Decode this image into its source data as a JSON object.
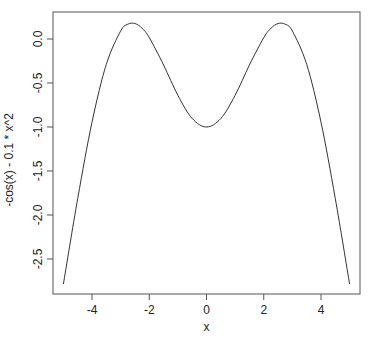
{
  "chart_data": {
    "type": "line",
    "title": "",
    "xlabel": "x",
    "ylabel": "-cos(x) - 0.1 * x^2",
    "xlim": [
      -5,
      5
    ],
    "ylim": [
      -2.78,
      0.18
    ],
    "grid": false,
    "legend": null,
    "x_ticks": [
      "-4",
      "-2",
      "0",
      "2",
      "4"
    ],
    "y_ticks": [
      "0.0",
      "-0.5",
      "-1.0",
      "-1.5",
      "-2.0",
      "-2.5"
    ],
    "series": [
      {
        "name": "-cos(x) - 0.1 * x^2",
        "x": [
          -5,
          -4.5,
          -4,
          -3.5,
          -3,
          -2.75,
          -2.5,
          -2.25,
          -2,
          -1.5,
          -1,
          -0.5,
          0,
          0.5,
          1,
          1.5,
          2,
          2.25,
          2.5,
          2.75,
          3,
          3.5,
          4,
          4.5,
          5
        ],
        "y": [
          -2.784,
          -1.814,
          -0.946,
          -0.289,
          0.09,
          0.168,
          0.176,
          0.122,
          0.016,
          -0.296,
          -0.64,
          -0.903,
          -1.0,
          -0.903,
          -0.64,
          -0.296,
          0.016,
          0.122,
          0.176,
          0.168,
          0.09,
          -0.289,
          -0.946,
          -1.814,
          -2.784
        ]
      }
    ]
  },
  "colors": {
    "line": "#333333",
    "axis": "#555555",
    "text": "#222222"
  }
}
